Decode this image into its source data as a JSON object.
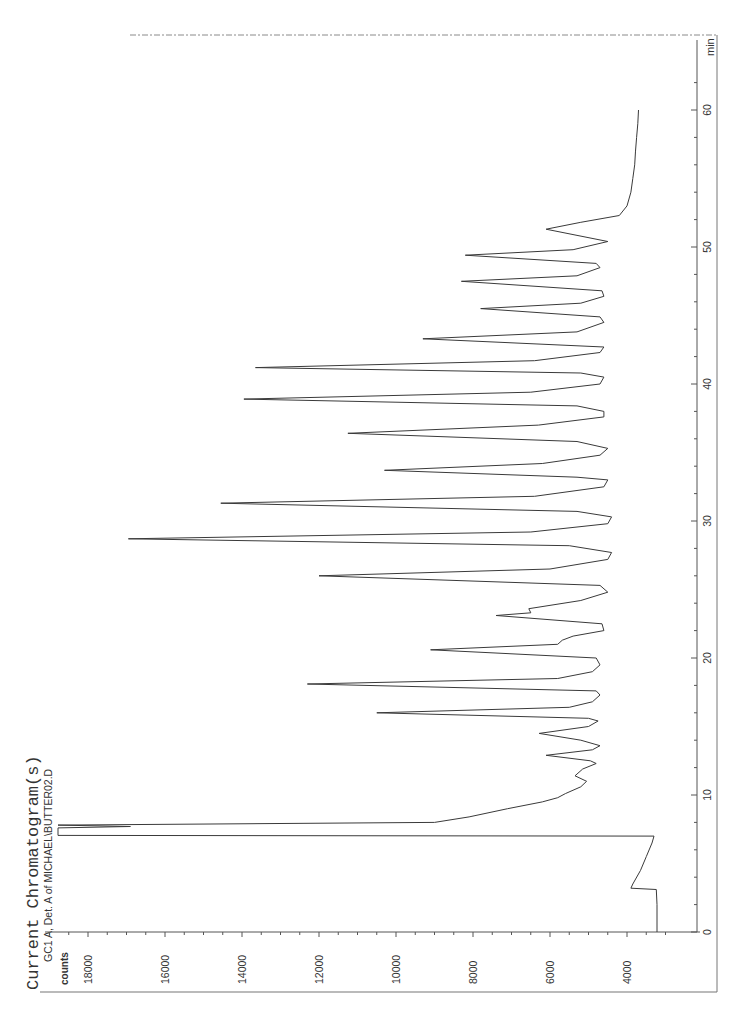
{
  "header": {
    "title": "Current Chromatogram(s)",
    "subtitle": "GC1 A, Det. A of MICHAEL\\BUTTER02.D"
  },
  "colors": {
    "trace": "#3a3a3a",
    "axis": "#555555",
    "frame": "#777777",
    "background": "#ffffff"
  },
  "chart_data": {
    "type": "line",
    "title": "Current Chromatogram(s)",
    "subtitle": "GC1 A, Det. A of MICHAEL\\BUTTER02.D",
    "xlabel": "min",
    "ylabel": "counts",
    "xlim": [
      0,
      62
    ],
    "ylim": [
      3000,
      19000
    ],
    "x_ticks": [
      0,
      10,
      20,
      30,
      40,
      50,
      60
    ],
    "x_tick_labels": [
      "0",
      "10",
      "20",
      "30",
      "40",
      "50",
      "60"
    ],
    "y_ticks": [
      4000,
      6000,
      8000,
      10000,
      12000,
      14000,
      16000,
      18000
    ],
    "y_tick_labels": [
      "4000",
      "6000",
      "8000",
      "10000",
      "12000",
      "14000",
      "16000",
      "18000"
    ],
    "grid": false,
    "legend": null,
    "orientation": "rotated 90° (time axis vertical, counts horizontal)",
    "series": [
      {
        "name": "GC1 A, Det. A",
        "points": [
          [
            0.0,
            3220
          ],
          [
            2.0,
            3220
          ],
          [
            3.1,
            3240
          ],
          [
            3.2,
            3900
          ],
          [
            3.5,
            3850
          ],
          [
            4.5,
            3650
          ],
          [
            5.5,
            3500
          ],
          [
            6.5,
            3350
          ],
          [
            7.0,
            3300
          ],
          [
            7.05,
            19500
          ],
          [
            7.6,
            19500
          ],
          [
            7.7,
            16900
          ],
          [
            7.8,
            19500
          ],
          [
            8.0,
            9000
          ],
          [
            8.4,
            8100
          ],
          [
            9.0,
            7100
          ],
          [
            9.5,
            6200
          ],
          [
            9.8,
            5800
          ],
          [
            10.1,
            5600
          ],
          [
            10.6,
            5200
          ],
          [
            11.0,
            5050
          ],
          [
            11.4,
            5350
          ],
          [
            11.9,
            5150
          ],
          [
            12.3,
            4800
          ],
          [
            12.5,
            4950
          ],
          [
            12.9,
            6100
          ],
          [
            13.3,
            4900
          ],
          [
            13.6,
            4700
          ],
          [
            14.0,
            5200
          ],
          [
            14.5,
            6280
          ],
          [
            15.0,
            5000
          ],
          [
            15.4,
            4750
          ],
          [
            15.6,
            5000
          ],
          [
            16.0,
            10500
          ],
          [
            16.4,
            5500
          ],
          [
            16.8,
            4900
          ],
          [
            17.3,
            4700
          ],
          [
            17.6,
            4800
          ],
          [
            18.1,
            12300
          ],
          [
            18.5,
            5800
          ],
          [
            19.0,
            4900
          ],
          [
            19.5,
            4700
          ],
          [
            20.0,
            4800
          ],
          [
            20.6,
            9100
          ],
          [
            21.0,
            5800
          ],
          [
            21.3,
            5680
          ],
          [
            21.6,
            5400
          ],
          [
            22.0,
            4600
          ],
          [
            22.5,
            4650
          ],
          [
            23.1,
            7400
          ],
          [
            23.3,
            6500
          ],
          [
            23.6,
            6550
          ],
          [
            24.2,
            5200
          ],
          [
            24.8,
            4500
          ],
          [
            25.3,
            4700
          ],
          [
            26.0,
            12000
          ],
          [
            26.5,
            6000
          ],
          [
            27.2,
            4500
          ],
          [
            27.7,
            4400
          ],
          [
            28.2,
            5500
          ],
          [
            28.7,
            16950
          ],
          [
            29.2,
            6500
          ],
          [
            29.8,
            4500
          ],
          [
            30.3,
            4400
          ],
          [
            30.7,
            5300
          ],
          [
            31.3,
            14550
          ],
          [
            31.8,
            6400
          ],
          [
            32.5,
            4600
          ],
          [
            33.0,
            4500
          ],
          [
            33.2,
            5300
          ],
          [
            33.7,
            10300
          ],
          [
            34.2,
            6200
          ],
          [
            34.8,
            4700
          ],
          [
            35.3,
            4500
          ],
          [
            35.8,
            5300
          ],
          [
            36.4,
            11250
          ],
          [
            37.0,
            6300
          ],
          [
            37.6,
            4600
          ],
          [
            38.0,
            4600
          ],
          [
            38.4,
            5300
          ],
          [
            38.9,
            13950
          ],
          [
            39.4,
            6500
          ],
          [
            40.0,
            4700
          ],
          [
            40.5,
            4600
          ],
          [
            40.8,
            5200
          ],
          [
            41.2,
            13650
          ],
          [
            41.7,
            6400
          ],
          [
            42.3,
            4700
          ],
          [
            42.7,
            4600
          ],
          [
            43.3,
            9300
          ],
          [
            43.8,
            5300
          ],
          [
            44.5,
            4600
          ],
          [
            44.9,
            4700
          ],
          [
            45.5,
            7800
          ],
          [
            45.9,
            5200
          ],
          [
            46.4,
            4600
          ],
          [
            46.8,
            4650
          ],
          [
            47.5,
            8300
          ],
          [
            47.9,
            5300
          ],
          [
            48.5,
            4700
          ],
          [
            48.8,
            4800
          ],
          [
            49.4,
            8200
          ],
          [
            49.8,
            5400
          ],
          [
            50.4,
            4500
          ],
          [
            51.3,
            6100
          ],
          [
            51.8,
            5200
          ],
          [
            52.3,
            4200
          ],
          [
            53.0,
            4000
          ],
          [
            54.0,
            3900
          ],
          [
            55.0,
            3850
          ],
          [
            56.0,
            3800
          ],
          [
            57.0,
            3780
          ],
          [
            58.0,
            3750
          ],
          [
            59.0,
            3720
          ],
          [
            60.0,
            3700
          ]
        ]
      }
    ],
    "annotated_peaks": [
      {
        "time": 7.5,
        "counts": "off-scale (solvent)"
      },
      {
        "time": 16.0,
        "counts": 10500
      },
      {
        "time": 18.1,
        "counts": 12300
      },
      {
        "time": 20.6,
        "counts": 9100
      },
      {
        "time": 23.1,
        "counts": 7400
      },
      {
        "time": 26.0,
        "counts": 12000
      },
      {
        "time": 28.7,
        "counts": 16950
      },
      {
        "time": 31.3,
        "counts": 14550
      },
      {
        "time": 33.7,
        "counts": 10300
      },
      {
        "time": 36.4,
        "counts": 11250
      },
      {
        "time": 38.9,
        "counts": 13950
      },
      {
        "time": 41.2,
        "counts": 13650
      },
      {
        "time": 43.3,
        "counts": 9300
      },
      {
        "time": 45.5,
        "counts": 7800
      },
      {
        "time": 47.5,
        "counts": 8300
      },
      {
        "time": 49.4,
        "counts": 8200
      },
      {
        "time": 51.3,
        "counts": 6100
      }
    ]
  }
}
